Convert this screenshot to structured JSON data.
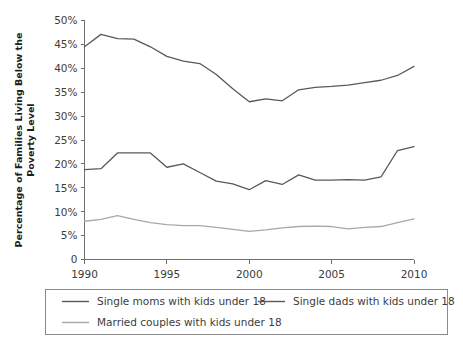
{
  "chart_data": {
    "type": "line",
    "title": "",
    "xlabel": "",
    "ylabel": "Percentage of Families Living Below the Poverty Level",
    "ylabel_lines": [
      "Percentage of Families Living Below the",
      "Poverty Level"
    ],
    "xlim": [
      1990,
      2010
    ],
    "ylim": [
      0,
      50
    ],
    "grid": false,
    "legend_position": "bottom",
    "x_tick_labels": [
      "1990",
      "1995",
      "2000",
      "2005",
      "2010"
    ],
    "x_ticks": [
      1990,
      1995,
      2000,
      2005,
      2010
    ],
    "y_tick_labels": [
      "0",
      "5%",
      "10%",
      "15%",
      "20%",
      "25%",
      "30%",
      "35%",
      "40%",
      "45%",
      "50%"
    ],
    "y_ticks": [
      0,
      5,
      10,
      15,
      20,
      25,
      30,
      35,
      40,
      45,
      50
    ],
    "x": [
      1990,
      1991,
      1992,
      1993,
      1994,
      1995,
      1996,
      1997,
      1998,
      1999,
      2000,
      2001,
      2002,
      2003,
      2004,
      2005,
      2006,
      2007,
      2008,
      2009,
      2010
    ],
    "series": [
      {
        "name": "Single moms with kids under 18",
        "color": "#595959",
        "values": [
          44.5,
          47.1,
          46.2,
          46.1,
          44.5,
          42.5,
          41.5,
          41.0,
          38.7,
          35.7,
          33.0,
          33.6,
          33.2,
          35.5,
          36.0,
          36.2,
          36.5,
          37.0,
          37.5,
          38.5,
          40.4
        ]
      },
      {
        "name": "Single dads with kids under 18",
        "color": "#595959",
        "values": [
          18.8,
          19.0,
          22.3,
          22.3,
          22.3,
          19.3,
          20.0,
          18.2,
          16.4,
          15.8,
          14.6,
          16.5,
          15.7,
          17.7,
          16.6,
          16.6,
          16.7,
          16.6,
          17.3,
          22.8,
          23.6
        ]
      },
      {
        "name": "Married couples with kids under 18",
        "color": "#a8a8a8",
        "values": [
          8.0,
          8.4,
          9.2,
          8.4,
          7.7,
          7.3,
          7.1,
          7.1,
          6.7,
          6.3,
          5.9,
          6.2,
          6.6,
          6.9,
          7.0,
          6.9,
          6.4,
          6.7,
          6.9,
          7.7,
          8.5
        ]
      }
    ]
  },
  "legend": {
    "items": [
      {
        "label": "Single moms with kids under 18",
        "color": "#595959"
      },
      {
        "label": "Single dads with kids under 18",
        "color": "#595959"
      },
      {
        "label": "Married couples with kids under 18",
        "color": "#a8a8a8"
      }
    ]
  }
}
